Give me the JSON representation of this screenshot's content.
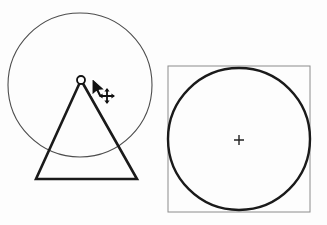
{
  "canvas": {
    "width": 327,
    "height": 225,
    "background_color": "#fdfdfd",
    "title": "Shape manipulation canvas",
    "description": "Two line drawings: a thin circle with a bold triangle whose apex is being dragged, and a bold circle inscribed in a thin rectangle with a center crosshair."
  },
  "colors": {
    "stroke_bold": "#1a1a1a",
    "stroke_thin": "#4d4d4d",
    "stroke_box": "#8c8c8c",
    "cursor_fill": "#111111",
    "cursor_outline": "#ffffff",
    "handle_fill": "#ffffff",
    "handle_stroke": "#111111"
  },
  "left_figure": {
    "name": "circle-with-triangle",
    "label": "Circle with inscribed triangle",
    "circle": {
      "name": "guide-circle",
      "label": "Guide circle",
      "cx": 80,
      "cy": 85,
      "r": 72,
      "stroke_width": 1.1,
      "style": "thin"
    },
    "triangle": {
      "name": "triangle-shape",
      "label": "Triangle",
      "points": "81,80 137,179 36,179",
      "apex": {
        "x": 81,
        "y": 80
      },
      "base_left": {
        "x": 36,
        "y": 179
      },
      "base_right": {
        "x": 137,
        "y": 179
      },
      "stroke_width": 2.6,
      "style": "bold"
    },
    "vertex_handle": {
      "name": "apex-vertex-handle",
      "label": "Apex vertex handle",
      "cx": 81,
      "cy": 80,
      "r": 4,
      "stroke_width": 1.8
    },
    "cursor": {
      "name": "arrow-cursor",
      "label": "Mouse pointer",
      "x": 92,
      "y": 78,
      "scale": 1.0
    },
    "move_badge": {
      "name": "move-cursor-icon",
      "label": "Move (four-way arrow) indicator",
      "cx": 107,
      "cy": 96,
      "arm": 7
    }
  },
  "right_figure": {
    "name": "circle-in-bounding-box",
    "label": "Circle with bounding box",
    "box": {
      "name": "bounding-box",
      "label": "Bounding box",
      "x": 168,
      "y": 66,
      "width": 142,
      "height": 146,
      "stroke_width": 1.0,
      "style": "thin"
    },
    "circle": {
      "name": "main-circle",
      "label": "Circle",
      "cx": 239,
      "cy": 139,
      "r": 71,
      "stroke_width": 2.4,
      "style": "bold"
    },
    "center_marker": {
      "name": "center-crosshair-icon",
      "label": "Center point marker",
      "cx": 239,
      "cy": 140,
      "arm": 5,
      "stroke_width": 1.4
    }
  },
  "a11y": {
    "left_caption": "Circle with triangle, apex vertex selected and being moved",
    "right_caption": "Circle inscribed in its bounding box with center crosshair"
  }
}
